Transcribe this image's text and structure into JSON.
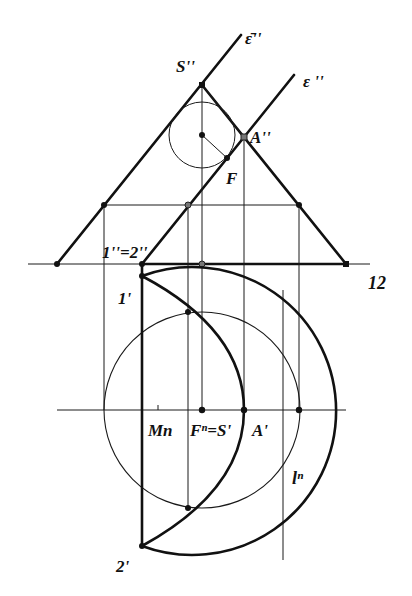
{
  "figure": {
    "type": "descriptive-geometry construction"
  },
  "labels": {
    "eps_bar": "ε̄''",
    "eps": "ε ''",
    "S2": "S''",
    "A2": "A''",
    "F": "F",
    "one2_eq_two2": "1''=2''",
    "axis12": "12",
    "one1": "1'",
    "Mn": "Mn",
    "Fn_eq_S1": "Fⁿ=S'",
    "A1": "A'",
    "ln": "lⁿ",
    "two1": "2'"
  },
  "colors": {
    "ink": "#111111",
    "background": "#ffffff"
  },
  "geometry": {
    "axis_y": 264,
    "apex_S2": [
      202,
      85
    ],
    "sphere_center": [
      202,
      135
    ],
    "sphere_radius": 33,
    "A2": [
      244,
      137
    ],
    "F": [
      227,
      158
    ],
    "plan_center": [
      202,
      410
    ],
    "outer_circle_radius": 144,
    "inner_circle_radius": 98,
    "point_1": [
      142,
      276
    ],
    "point_2": [
      142,
      546
    ]
  }
}
